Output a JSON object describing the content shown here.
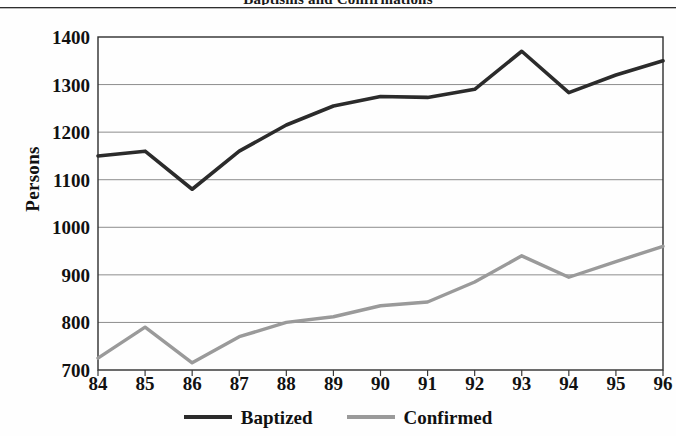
{
  "figure": {
    "title_remnant": "Baptisms and Confirmations",
    "background_color": "#fefefe"
  },
  "chart_data": {
    "type": "line",
    "title": "",
    "xlabel": "",
    "ylabel": "Persons",
    "x": [
      "84",
      "85",
      "86",
      "87",
      "88",
      "89",
      "90",
      "91",
      "92",
      "93",
      "94",
      "95",
      "96"
    ],
    "categories": [
      "84",
      "85",
      "86",
      "87",
      "88",
      "89",
      "90",
      "91",
      "92",
      "93",
      "94",
      "95",
      "96"
    ],
    "series": [
      {
        "name": "Baptized",
        "color": "#2b2b2b",
        "values": [
          1150,
          1160,
          1080,
          1160,
          1215,
          1255,
          1275,
          1273,
          1290,
          1370,
          1283,
          1320,
          1350
        ]
      },
      {
        "name": "Confirmed",
        "color": "#9a9a9a",
        "values": [
          725,
          790,
          715,
          770,
          800,
          812,
          835,
          843,
          885,
          940,
          895,
          928,
          960
        ]
      }
    ],
    "ylim": [
      700,
      1400
    ],
    "yticks": [
      700,
      800,
      900,
      1000,
      1100,
      1200,
      1300,
      1400
    ],
    "ytick_labels": [
      "700",
      "800",
      "900",
      "1000",
      "1100",
      "1200",
      "1300",
      "1400"
    ],
    "xtick_labels": [
      "84",
      "85",
      "86",
      "87",
      "88",
      "89",
      "90",
      "91",
      "92",
      "93",
      "94",
      "95",
      "96"
    ],
    "grid": true,
    "grid_axis": "y",
    "grid_color": "#8d8d8d",
    "legend_position": "bottom",
    "legend": [
      {
        "label": "Baptized",
        "color": "#2b2b2b"
      },
      {
        "label": "Confirmed",
        "color": "#9a9a9a"
      }
    ]
  }
}
